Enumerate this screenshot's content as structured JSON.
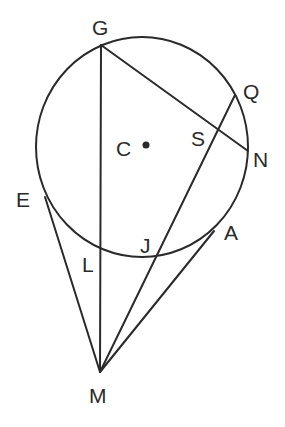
{
  "diagram": {
    "type": "circle-geometry",
    "circle": {
      "center_label": "C",
      "cx": 142,
      "cy": 147,
      "rx": 106,
      "ry": 110
    },
    "points": {
      "G": {
        "x": 101,
        "y": 45
      },
      "Q": {
        "x": 235,
        "y": 95
      },
      "S": {
        "x": 217,
        "y": 131
      },
      "N": {
        "x": 248,
        "y": 151
      },
      "C": {
        "x": 146,
        "y": 145
      },
      "E": {
        "x": 45,
        "y": 197
      },
      "L": {
        "x": 101,
        "y": 251
      },
      "J": {
        "x": 158,
        "y": 257
      },
      "A": {
        "x": 214,
        "y": 231
      },
      "M": {
        "x": 100,
        "y": 372
      }
    },
    "segments": [
      [
        "G",
        "M"
      ],
      [
        "G",
        "N"
      ],
      [
        "Q",
        "M"
      ],
      [
        "E",
        "M"
      ],
      [
        "A",
        "M"
      ]
    ],
    "labels": {
      "G": "G",
      "Q": "Q",
      "S": "S",
      "N": "N",
      "C": "C",
      "E": "E",
      "L": "L",
      "J": "J",
      "A": "A",
      "M": "M"
    }
  }
}
